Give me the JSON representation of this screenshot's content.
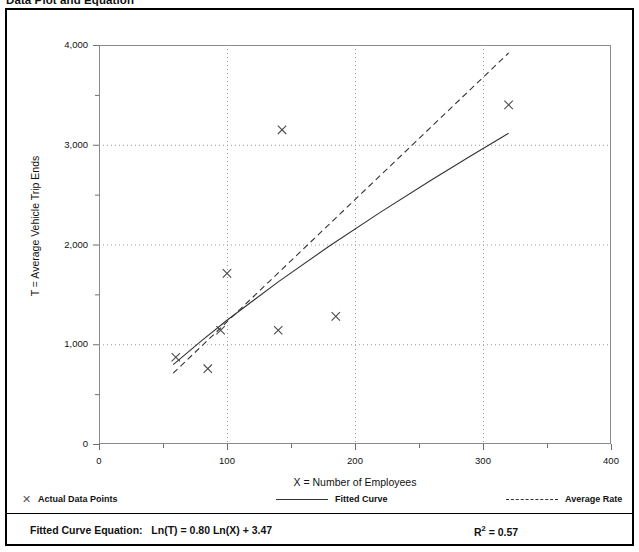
{
  "page": {
    "title": "Data Plot and Equation"
  },
  "legend": {
    "items": [
      {
        "label": "Actual Data Points",
        "marker": "x-marker-icon"
      },
      {
        "label": "Fitted Curve",
        "marker": "solid-line-icon"
      },
      {
        "label": "Average Rate",
        "marker": "dashed-line-icon"
      }
    ]
  },
  "equation": {
    "label": "Fitted Curve Equation:",
    "expression": "Ln(T) = 0.80 Ln(X) + 3.47",
    "r_squared_label": "R",
    "r_squared_exp": "2",
    "r_squared_value": "= 0.57"
  },
  "chart_data": {
    "type": "scatter",
    "title": "Data Plot and Equation",
    "xlabel": "X = Number of Employees",
    "ylabel": "T = Average Vehicle Trip Ends",
    "xlim": [
      0,
      400
    ],
    "ylim": [
      0,
      4000
    ],
    "xticks": [
      0,
      50,
      100,
      150,
      200,
      250,
      300,
      350,
      400
    ],
    "xtick_labels": [
      "0",
      "",
      "100",
      "",
      "200",
      "",
      "300",
      "",
      "400"
    ],
    "yticks": [
      0,
      500,
      1000,
      1500,
      2000,
      2500,
      3000,
      3500,
      4000
    ],
    "ytick_labels": [
      "0",
      "",
      "1,000",
      "",
      "2,000",
      "",
      "3,000",
      "",
      "4,000"
    ],
    "grid": "dotted-major-gridlines",
    "legend_position": "below-axes",
    "series": [
      {
        "name": "Actual Data Points",
        "type": "scatter",
        "marker": "x",
        "color": "#4a4a4a",
        "points": [
          {
            "x": 60,
            "y": 870
          },
          {
            "x": 85,
            "y": 755
          },
          {
            "x": 95,
            "y": 1140
          },
          {
            "x": 100,
            "y": 1710
          },
          {
            "x": 140,
            "y": 1140
          },
          {
            "x": 143,
            "y": 3150
          },
          {
            "x": 185,
            "y": 1280
          },
          {
            "x": 320,
            "y": 3400
          }
        ]
      },
      {
        "name": "Fitted Curve",
        "type": "line",
        "style": "solid",
        "color": "#333333",
        "equation": "Ln(T) = 0.80 Ln(X) + 3.47",
        "r_squared": 0.57,
        "points": [
          {
            "x": 58,
            "y": 795
          },
          {
            "x": 80,
            "y": 1035
          },
          {
            "x": 100,
            "y": 1240
          },
          {
            "x": 140,
            "y": 1625
          },
          {
            "x": 180,
            "y": 1985
          },
          {
            "x": 220,
            "y": 2325
          },
          {
            "x": 260,
            "y": 2650
          },
          {
            "x": 290,
            "y": 2885
          },
          {
            "x": 320,
            "y": 3115
          }
        ]
      },
      {
        "name": "Average Rate",
        "type": "line",
        "style": "dashed",
        "color": "#333333",
        "points": [
          {
            "x": 58,
            "y": 710
          },
          {
            "x": 320,
            "y": 3920
          }
        ]
      }
    ]
  }
}
